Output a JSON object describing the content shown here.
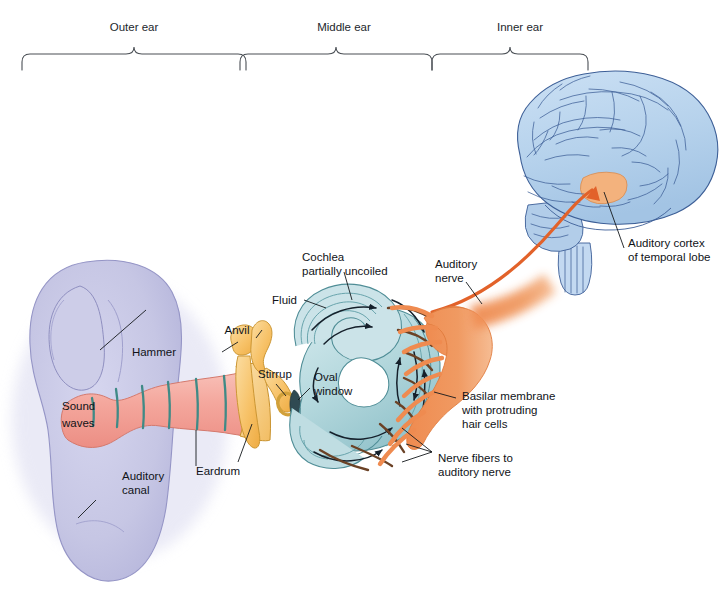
{
  "figure": {
    "type": "anatomical-diagram"
  },
  "regions": [
    {
      "id": "outer",
      "label": "Outer ear"
    },
    {
      "id": "middle",
      "label": "Middle ear"
    },
    {
      "id": "inner",
      "label": "Inner ear"
    }
  ],
  "labels": {
    "sound_waves": "Sound\nwaves",
    "sound_waves_line1": "Sound",
    "sound_waves_line2": "waves",
    "auditory_canal_line1": "Auditory",
    "auditory_canal_line2": "canal",
    "eardrum": "Eardrum",
    "hammer": "Hammer",
    "anvil": "Anvil",
    "stirrup": "Stirrup",
    "oval_window_line1": "Oval",
    "oval_window_line2": "window",
    "cochlea_line1": "Cochlea",
    "cochlea_line2": "partially uncoiled",
    "fluid": "Fluid",
    "auditory_nerve_line1": "Auditory",
    "auditory_nerve_line2": "nerve",
    "basilar_line1": "Basilar membrane",
    "basilar_line2": "with protruding",
    "basilar_line3": "hair cells",
    "nerve_fibers_line1": "Nerve fibers to",
    "nerve_fibers_line2": "auditory nerve",
    "cortex_line1": "Auditory cortex",
    "cortex_line2": "of temporal lobe"
  },
  "colors": {
    "background": "#ffffff",
    "pinna_fill": "#c3c3e2",
    "pinna_edge": "#8f8fc0",
    "canal_fill": "#f4a9a0",
    "canal_edge": "#d4796d",
    "canal_ridge": "#3f8a86",
    "ossicle_fill": "#f8c877",
    "ossicle_edge": "#c9932f",
    "eardrum_fill": "#f8d79a",
    "cochlea_fill": "#bcdbe0",
    "cochlea_edge": "#4f8d96",
    "nerve_fill": "#ef8murder",
    "nerve_orange": "#ef8b50",
    "brain_fill": "#b9d4ee",
    "brain_edge": "#3d5f97",
    "cortex_fill": "#f3b27d",
    "label_text": "#101318",
    "leader_line": "#14181c"
  },
  "pathway_order": [
    "Sound waves",
    "Auditory canal",
    "Eardrum",
    "Hammer",
    "Anvil",
    "Stirrup",
    "Oval window",
    "Cochlea",
    "Basilar membrane with protruding hair cells",
    "Nerve fibers to auditory nerve",
    "Auditory nerve",
    "Auditory cortex of temporal lobe"
  ]
}
